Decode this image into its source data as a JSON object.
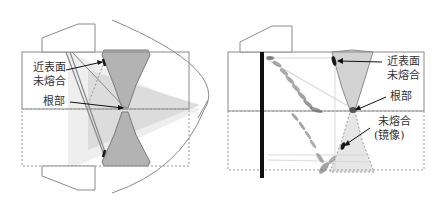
{
  "left": {
    "labels": {
      "near_surface_lof_line1": "近表面",
      "near_surface_lof_line2": "未熔合",
      "root": "根部"
    }
  },
  "right": {
    "labels": {
      "near_surface_lof_line1": "近表面",
      "near_surface_lof_line2": "未熔合",
      "root": "根部",
      "lof_mirror_line1": "未熔合",
      "lof_mirror_line2": "(镜像)"
    }
  },
  "colors": {
    "outline": "#8a8a8a",
    "weld_fill": "#b5b5b5",
    "beam_fill": "#d6d6d6",
    "defect": "#1a1a1a",
    "probe_bar": "#111111"
  }
}
